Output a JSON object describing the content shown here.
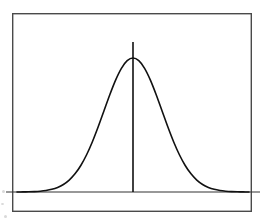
{
  "figure": {
    "kind": "bell-curve-diagram",
    "caption": "",
    "background_color": "#ffffff",
    "frame": {
      "name": "figure-border",
      "x": 12,
      "y": 13,
      "width": 240,
      "height": 199,
      "stroke_color": "#4a4a4a",
      "stroke_width": 1.4
    }
  },
  "chart_data": {
    "type": "line",
    "title": "",
    "subtitle": "",
    "xlabel": "",
    "ylabel": "",
    "legend": [],
    "legend_position": "none",
    "grid": false,
    "axis_visible": {
      "x": true,
      "y": false
    },
    "xlim": [
      -4.0,
      4.0
    ],
    "ylim": [
      0.0,
      1.12
    ],
    "xticks": [],
    "yticks": [],
    "xticklabels": [],
    "yticklabels": [],
    "annotations": [
      {
        "name": "mean-line",
        "type": "vline",
        "x": 0.0,
        "y_from": 0.0,
        "y_to": 1.12,
        "label": "",
        "color": "#111111",
        "width": 1.6
      }
    ],
    "series": [
      {
        "name": "normal-distribution",
        "color": "#111111",
        "line_width": 1.6,
        "mean": 0.0,
        "sigma": 1.0,
        "peak_value": 1.0,
        "x": [
          -4.0,
          -3.8,
          -3.6,
          -3.4,
          -3.2,
          -3.0,
          -2.8,
          -2.6,
          -2.4,
          -2.2,
          -2.0,
          -1.8,
          -1.6,
          -1.4,
          -1.2,
          -1.0,
          -0.8,
          -0.6,
          -0.4,
          -0.2,
          0.0,
          0.2,
          0.4,
          0.6,
          0.8,
          1.0,
          1.2,
          1.4,
          1.6,
          1.8,
          2.0,
          2.2,
          2.4,
          2.6,
          2.8,
          3.0,
          3.2,
          3.4,
          3.6,
          3.8,
          4.0
        ],
        "values": [
          0.0003,
          0.0007,
          0.0015,
          0.003,
          0.006,
          0.0111,
          0.0198,
          0.034,
          0.0561,
          0.0889,
          0.1353,
          0.1979,
          0.278,
          0.3753,
          0.4868,
          0.6065,
          0.7261,
          0.8353,
          0.9231,
          0.9802,
          1.0,
          0.9802,
          0.9231,
          0.8353,
          0.7261,
          0.6065,
          0.4868,
          0.3753,
          0.278,
          0.1979,
          0.1353,
          0.0889,
          0.0561,
          0.034,
          0.0198,
          0.0111,
          0.006,
          0.003,
          0.0015,
          0.0007,
          0.0003
        ]
      }
    ],
    "baseline": {
      "name": "x-axis-baseline",
      "y": 0.0,
      "x_from": -4.0,
      "x_to": 4.0,
      "color": "#333333",
      "width": 1.2
    }
  }
}
